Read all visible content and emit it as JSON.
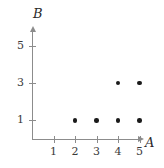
{
  "chart_data": {
    "type": "scatter",
    "title": "",
    "xlabel": "A",
    "ylabel": "B",
    "points": [
      {
        "x": 2,
        "y": 1
      },
      {
        "x": 3,
        "y": 1
      },
      {
        "x": 4,
        "y": 1
      },
      {
        "x": 5,
        "y": 1
      },
      {
        "x": 4,
        "y": 3
      },
      {
        "x": 5,
        "y": 3
      }
    ],
    "x_ticks": [
      1,
      2,
      3,
      4,
      5
    ],
    "x_tick_labels": [
      "1",
      "2",
      "3",
      "4",
      "5"
    ],
    "y_ticks": [
      1,
      3,
      5
    ],
    "y_tick_labels": [
      "1",
      "3",
      "5"
    ],
    "xlim": [
      0,
      6
    ],
    "ylim": [
      0,
      6
    ],
    "grid": false,
    "legend": null,
    "marker_color": "#1a1a1a",
    "axis_color": "#8c8c8c",
    "text_color": "#3a3a3a",
    "background": "#ffffff"
  },
  "axes": {
    "x_name": "A",
    "y_name": "B"
  }
}
